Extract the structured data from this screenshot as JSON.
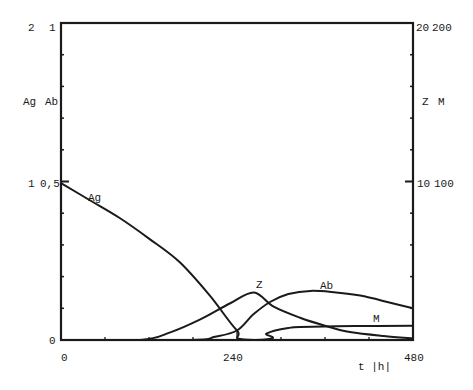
{
  "chart_data": {
    "type": "line",
    "title": "",
    "xlabel": "t |h|",
    "xlim": [
      0,
      480
    ],
    "x_ticks": [
      0,
      240,
      480
    ],
    "x_minor_ticks": [
      60,
      120,
      180,
      240,
      300,
      360,
      420
    ],
    "left_axis": {
      "labels": [
        "Ag",
        "Ab"
      ],
      "Ag_range": [
        0,
        2
      ],
      "Ab_range": [
        0,
        1
      ],
      "tick_labels": [
        {
          "Ag": "2",
          "Ab": "1",
          "frac": 1.0
        },
        {
          "Ag": "1",
          "Ab": "0,5",
          "frac": 0.5
        },
        {
          "Ag": "",
          "Ab": "0",
          "frac": 0.0
        }
      ]
    },
    "right_axis": {
      "labels": [
        "Z",
        "M"
      ],
      "Z_range": [
        0,
        20
      ],
      "M_range": [
        0,
        200
      ],
      "tick_labels": [
        {
          "Z": "20",
          "M": "200",
          "frac": 1.0
        },
        {
          "Z": "10",
          "M": "100",
          "frac": 0.5
        }
      ]
    },
    "grid": false,
    "legend": "inline labels on curves",
    "series": [
      {
        "name": "Ag",
        "axis": "left",
        "scale_max": 2,
        "points": [
          [
            0,
            0.99
          ],
          [
            40,
            0.88
          ],
          [
            80,
            0.77
          ],
          [
            120,
            0.64
          ],
          [
            162,
            0.49
          ],
          [
            203,
            0.28
          ],
          [
            240,
            0.06
          ],
          [
            263,
            0.0
          ],
          [
            480,
            0.0
          ]
        ]
      },
      {
        "name": "Z",
        "axis": "right",
        "scale_max": 20,
        "points": [
          [
            0,
            0
          ],
          [
            108,
            0
          ],
          [
            150,
            0.5
          ],
          [
            190,
            1.3
          ],
          [
            230,
            2.3
          ],
          [
            263,
            3.0
          ],
          [
            290,
            2.1
          ],
          [
            326,
            1.4
          ],
          [
            360,
            0.9
          ],
          [
            394,
            0.5
          ],
          [
            440,
            0.25
          ],
          [
            480,
            0.1
          ]
        ]
      },
      {
        "name": "Ab",
        "axis": "left",
        "scale_max": 1,
        "points": [
          [
            0,
            0
          ],
          [
            176,
            0
          ],
          [
            210,
            0.01
          ],
          [
            240,
            0.03
          ],
          [
            262,
            0.08
          ],
          [
            285,
            0.12
          ],
          [
            310,
            0.145
          ],
          [
            340,
            0.155
          ],
          [
            375,
            0.15
          ],
          [
            408,
            0.14
          ],
          [
            445,
            0.12
          ],
          [
            480,
            0.1
          ]
        ]
      },
      {
        "name": "M",
        "axis": "right",
        "scale_max": 200,
        "points": [
          [
            0,
            0
          ],
          [
            265,
            0
          ],
          [
            280,
            4
          ],
          [
            292,
            6
          ],
          [
            310,
            7.5
          ],
          [
            326,
            8.2
          ],
          [
            400,
            8.8
          ],
          [
            480,
            9.0
          ]
        ]
      }
    ]
  },
  "labels": {
    "left_top_Ag": "2",
    "left_top_Ab": "1",
    "left_axis_Ag": "Ag",
    "left_axis_Ab": "Ab",
    "left_mid_Ag": "1",
    "left_mid_Ab": "0,5",
    "left_zero": "0",
    "right_top_Z": "20",
    "right_top_M": "200",
    "right_axis_Z": "Z",
    "right_axis_M": "M",
    "right_mid_Z": "10",
    "right_mid_M": "100",
    "x_tick_0": "0",
    "x_tick_240": "240",
    "x_tick_480": "480",
    "x_axis_label": "t |h|",
    "curve_Ag": "Ag",
    "curve_Z": "Z",
    "curve_Ab": "Ab",
    "curve_M": "M"
  }
}
